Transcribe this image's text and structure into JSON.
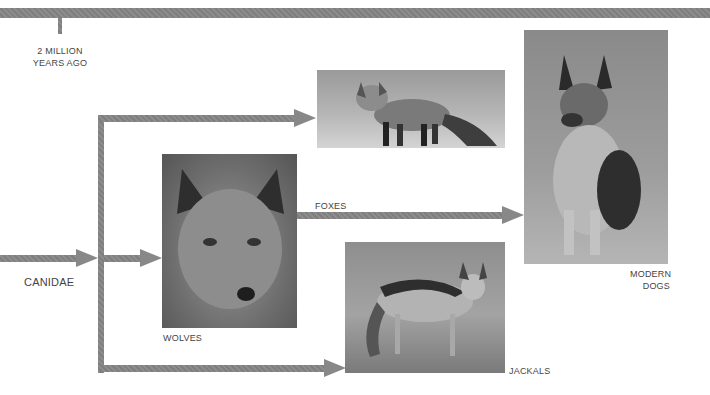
{
  "timeline": {
    "label_line1": "2 MILLION",
    "label_line2": "YEARS AGO"
  },
  "root": {
    "label": "CANIDAE"
  },
  "nodes": {
    "wolves": {
      "label": "WOLVES",
      "image": "wolf-photo"
    },
    "foxes": {
      "label": "FOXES",
      "image": "fox-photo"
    },
    "jackals": {
      "label": "JACKALS",
      "image": "jackal-photo"
    },
    "dogs": {
      "label_line1": "MODERN",
      "label_line2": "DOGS",
      "image": "german-shepherd-photo"
    }
  },
  "colors": {
    "arrow": "#888888",
    "text": "#444444",
    "background": "#ffffff"
  }
}
